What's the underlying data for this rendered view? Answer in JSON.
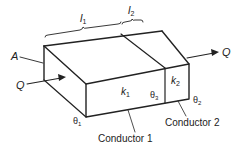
{
  "diagram": {
    "labels": {
      "l1": "l",
      "l1_sub": "1",
      "l2": "l",
      "l2_sub": "2",
      "area": "A",
      "q_in": "Q",
      "q_out": "Q",
      "k1": "k",
      "k1_sub": "1",
      "k2": "k",
      "k2_sub": "2",
      "theta1": "θ",
      "theta1_sub": "1",
      "theta2": "θ",
      "theta2_sub": "2",
      "theta3": "θ",
      "theta3_sub": "3",
      "conductor1": "Conductor 1",
      "conductor2": "Conductor 2"
    },
    "colors": {
      "stroke": "#222222",
      "background": "#ffffff"
    }
  }
}
